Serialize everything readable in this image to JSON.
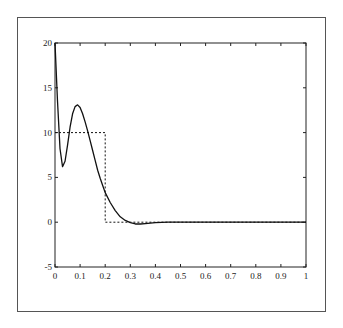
{
  "chart_data": {
    "type": "line",
    "title": "",
    "xlabel": "",
    "ylabel": "",
    "xlim": [
      0,
      1
    ],
    "ylim": [
      -5,
      20
    ],
    "grid": false,
    "legend": null,
    "x_ticks": [
      "0",
      "0.1",
      "0.2",
      "0.3",
      "0.4",
      "0.5",
      "0.6",
      "0.7",
      "0.8",
      "0.9",
      "1"
    ],
    "y_ticks": [
      "-5",
      "0",
      "5",
      "10",
      "15",
      "20"
    ],
    "series": [
      {
        "name": "approximation (solid)",
        "style": "solid",
        "x": [
          0,
          0.01,
          0.02,
          0.03,
          0.04,
          0.05,
          0.06,
          0.07,
          0.08,
          0.09,
          0.1,
          0.11,
          0.12,
          0.13,
          0.14,
          0.15,
          0.16,
          0.17,
          0.18,
          0.19,
          0.2,
          0.22,
          0.24,
          0.26,
          0.28,
          0.3,
          0.32,
          0.34,
          0.36,
          0.4,
          0.45,
          0.5,
          0.6,
          0.7,
          0.8,
          0.9,
          1.0
        ],
        "values": [
          20,
          13.5,
          8.2,
          6.2,
          6.8,
          8.6,
          10.6,
          12.1,
          12.9,
          13.1,
          12.8,
          12.1,
          11.2,
          10.2,
          9.1,
          8.0,
          6.9,
          5.8,
          4.9,
          4.1,
          3.3,
          2.2,
          1.3,
          0.6,
          0.2,
          -0.05,
          -0.2,
          -0.2,
          -0.15,
          -0.05,
          0,
          0,
          0,
          0,
          0,
          0,
          0
        ]
      },
      {
        "name": "step function (dashed)",
        "style": "dashed",
        "x": [
          0,
          0.2,
          0.2,
          1.0
        ],
        "values": [
          10,
          10,
          0,
          0
        ]
      }
    ]
  }
}
